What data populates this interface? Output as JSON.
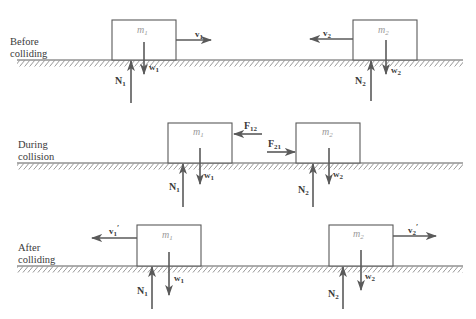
{
  "colors": {
    "stroke": "#5a5a5a",
    "hatch": "#8a8a8a",
    "text": "#3a3a3a",
    "mass_text": "#9a9a9a",
    "background": "#ffffff"
  },
  "stages": [
    {
      "id": "before",
      "label_line1": "Before",
      "label_line2": "colliding",
      "ground_y": 60,
      "blocks": [
        {
          "name": "m",
          "sub": "1",
          "x": 112,
          "y": 20,
          "w": 64,
          "h": 40,
          "normal": {
            "label": "N",
            "sub": "1"
          },
          "weight": {
            "label": "w",
            "sub": "1"
          },
          "velocity": {
            "label": "v",
            "sub": "1",
            "prime": "",
            "direction": "right"
          }
        },
        {
          "name": "m",
          "sub": "2",
          "x": 353,
          "y": 20,
          "w": 64,
          "h": 40,
          "normal": {
            "label": "N",
            "sub": "2"
          },
          "weight": {
            "label": "w",
            "sub": "2"
          },
          "velocity": {
            "label": "v",
            "sub": "2",
            "prime": "",
            "direction": "left"
          }
        }
      ]
    },
    {
      "id": "during",
      "label_line1": "During",
      "label_line2": "collision",
      "ground_y": 163,
      "blocks": [
        {
          "name": "m",
          "sub": "1",
          "x": 168,
          "y": 123,
          "w": 64,
          "h": 40,
          "normal": {
            "label": "N",
            "sub": "1"
          },
          "weight": {
            "label": "w",
            "sub": "1"
          }
        },
        {
          "name": "m",
          "sub": "2",
          "x": 296,
          "y": 123,
          "w": 64,
          "h": 40,
          "normal": {
            "label": "N",
            "sub": "2"
          },
          "weight": {
            "label": "w",
            "sub": "2"
          }
        }
      ],
      "forces": [
        {
          "label": "F",
          "sub": "12",
          "direction": "left",
          "on": "m1"
        },
        {
          "label": "F",
          "sub": "21",
          "direction": "right",
          "on": "m2"
        }
      ]
    },
    {
      "id": "after",
      "label_line1": "After",
      "label_line2": "colliding",
      "ground_y": 266,
      "blocks": [
        {
          "name": "m",
          "sub": "1",
          "x": 137,
          "y": 225,
          "w": 64,
          "h": 41,
          "normal": {
            "label": "N",
            "sub": "1"
          },
          "weight": {
            "label": "w",
            "sub": "1"
          },
          "velocity": {
            "label": "v",
            "sub": "1",
            "prime": "′",
            "direction": "left"
          }
        },
        {
          "name": "m",
          "sub": "2",
          "x": 329,
          "y": 225,
          "w": 64,
          "h": 41,
          "normal": {
            "label": "N",
            "sub": "2"
          },
          "weight": {
            "label": "w",
            "sub": "2"
          },
          "velocity": {
            "label": "v",
            "sub": "2",
            "prime": "′",
            "direction": "right"
          }
        }
      ]
    }
  ]
}
